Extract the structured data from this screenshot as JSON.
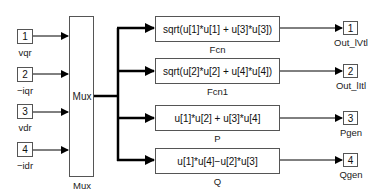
{
  "diagram": {
    "inports": [
      {
        "number": "1",
        "name": "vqr"
      },
      {
        "number": "2",
        "name": "−iqr"
      },
      {
        "number": "3",
        "name": "vdr"
      },
      {
        "number": "4",
        "name": "−idr"
      }
    ],
    "mux": {
      "inner_label": "Mux",
      "name": "Mux"
    },
    "functions": [
      {
        "expression": "sqrt(u[1]*u[1] + u[3]*u[3])",
        "name": "Fcn"
      },
      {
        "expression": "sqrt(u[2]*u[2] + u[4]*u[4])",
        "name": "Fcn1"
      },
      {
        "expression": "u[1]*u[2] + u[3]*u[4]",
        "name": "P"
      },
      {
        "expression": "u[1]*u[4]−u[2]*u[3]",
        "name": "Q"
      }
    ],
    "outports": [
      {
        "number": "1",
        "name": "Out_lVtl"
      },
      {
        "number": "2",
        "name": "Out_lItl"
      },
      {
        "number": "3",
        "name": "Pgen"
      },
      {
        "number": "4",
        "name": "Qgen"
      }
    ]
  }
}
